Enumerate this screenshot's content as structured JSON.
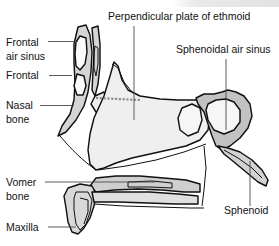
{
  "figure": {
    "background_color": "#ffffff",
    "outline_color": "#111111",
    "leader_color": "#4a4a4a"
  },
  "palette": {
    "bone_light": "#ececec",
    "bone_pale": "#f4f4f4",
    "bone_mid": "#c9c9c9",
    "bone_dark": "#a8a8a8",
    "cavity_white": "#ffffff",
    "suture_gray": "#8d8d8d"
  },
  "labels": [
    {
      "id": "frontal-air-sinus",
      "lines": [
        "Frontal",
        "air sinus"
      ],
      "line1": "Frontal",
      "line2": "air sinus",
      "anchor": "start",
      "x": 6,
      "y1": 46,
      "y2": 60,
      "leader": "M 48 41.5 L 78 41.5"
    },
    {
      "id": "frontal",
      "lines": [
        "Frontal"
      ],
      "line1": "Frontal",
      "line2": "",
      "anchor": "start",
      "x": 6,
      "y1": 79,
      "y2": 0,
      "leader": "M 49 75.5 L 72 75.5"
    },
    {
      "id": "nasal-bone",
      "lines": [
        "Nasal",
        "bone"
      ],
      "line1": "Nasal",
      "line2": "bone",
      "anchor": "start",
      "x": 6,
      "y1": 109,
      "y2": 123,
      "leader": "M 40 105.5 L 74 105.5"
    },
    {
      "id": "perpendicular-plate-of-ethmoid",
      "lines": [
        "Perpendicular plate of ethmoid"
      ],
      "line1": "Perpendicular plate of ethmoid",
      "line2": "",
      "anchor": "start",
      "x": 108,
      "y1": 20,
      "y2": 0,
      "leader": "M 134 26 L 134 120"
    },
    {
      "id": "sphenoidal-air-sinus",
      "lines": [
        "Sphenoidal air sinus"
      ],
      "line1": "Sphenoidal air sinus",
      "line2": "",
      "anchor": "start",
      "x": 176,
      "y1": 53,
      "y2": 0,
      "leader": "M 226 59 L 226 130"
    },
    {
      "id": "vomer-bone",
      "lines": [
        "Vomer",
        "bone"
      ],
      "line1": "Vomer",
      "line2": "bone",
      "anchor": "start",
      "x": 6,
      "y1": 186,
      "y2": 200,
      "leader": "M 45 182 L 155 182"
    },
    {
      "id": "maxilla",
      "lines": [
        "Maxilla"
      ],
      "line1": "Maxilla",
      "line2": "",
      "anchor": "start",
      "x": 6,
      "y1": 231,
      "y2": 0,
      "leader": "M 48 227 L 76 227"
    },
    {
      "id": "sphenoid",
      "lines": [
        "Sphenoid"
      ],
      "line1": "Sphenoid",
      "line2": "",
      "anchor": "start",
      "x": 224,
      "y1": 214,
      "y2": 0,
      "leader": "M 250 161 L 250 206"
    }
  ],
  "structures": [
    {
      "id": "frontal-bone",
      "name": "Frontal bone"
    },
    {
      "id": "frontal-air-sinus-cavity",
      "name": "Frontal air sinus cavity"
    },
    {
      "id": "nasal-bone-shape",
      "name": "Nasal bone"
    },
    {
      "id": "perpendicular-plate",
      "name": "Perpendicular plate of ethmoid"
    },
    {
      "id": "ethmoid-suture",
      "name": "Ethmoid suture hatching"
    },
    {
      "id": "sphenoid-body",
      "name": "Sphenoid body"
    },
    {
      "id": "sphenoidal-sinus-cavity",
      "name": "Sphenoidal air sinus cavity"
    },
    {
      "id": "vomer",
      "name": "Vomer bone"
    },
    {
      "id": "maxilla-shape",
      "name": "Maxilla / palatine process"
    },
    {
      "id": "pterygoid-process",
      "name": "Pterygoid process of sphenoid"
    }
  ]
}
